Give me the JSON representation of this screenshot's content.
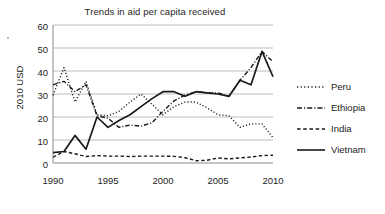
{
  "chart_data": {
    "type": "line",
    "title": "Trends in aid per capita received",
    "xlabel": "",
    "ylabel": "2010 USD",
    "xlim": [
      1990,
      2010
    ],
    "ylim": [
      0,
      60
    ],
    "grid": true,
    "legend_position": "right",
    "x": [
      1990,
      1991,
      1992,
      1993,
      1994,
      1995,
      1996,
      1997,
      1998,
      1999,
      2000,
      2001,
      2002,
      2003,
      2004,
      2005,
      2006,
      2007,
      2008,
      2009,
      2010
    ],
    "xticks": [
      "1990",
      "1995",
      "2000",
      "2005",
      "2010"
    ],
    "yticks": [
      "0",
      "10",
      "20",
      "30",
      "40",
      "50",
      "60"
    ],
    "series": [
      {
        "name": "Peru",
        "style": "dotted",
        "values": [
          29.5,
          41.5,
          26.5,
          35.5,
          21.0,
          20.5,
          22.5,
          26.5,
          30.0,
          25.5,
          21.0,
          24.5,
          26.5,
          26.5,
          24.0,
          21.0,
          20.5,
          15.5,
          17.0,
          17.0,
          11.0
        ]
      },
      {
        "name": "Ethiopia",
        "style": "dash-dot",
        "values": [
          34.0,
          35.5,
          31.0,
          34.0,
          20.5,
          19.5,
          15.5,
          16.5,
          16.0,
          17.5,
          22.5,
          27.0,
          29.5,
          31.0,
          30.5,
          30.5,
          29.0,
          36.0,
          41.5,
          48.5,
          44.0
        ]
      },
      {
        "name": "India",
        "style": "dashed",
        "values": [
          2.5,
          5.0,
          4.0,
          2.8,
          3.2,
          3.0,
          3.0,
          2.8,
          3.0,
          3.0,
          3.0,
          2.9,
          2.3,
          1.0,
          1.2,
          2.2,
          1.8,
          2.2,
          2.6,
          3.2,
          3.4
        ]
      },
      {
        "name": "Vietnam",
        "style": "solid",
        "values": [
          4.5,
          5.0,
          12.0,
          6.0,
          20.0,
          15.5,
          18.5,
          21.0,
          24.5,
          28.0,
          31.0,
          31.0,
          29.0,
          31.0,
          30.5,
          30.0,
          29.0,
          36.0,
          34.0,
          48.5,
          37.5
        ]
      }
    ],
    "colors": {
      "ink": "#1a1a1a",
      "grid": "#b5b5b5",
      "axis": "#8c8c8c",
      "background": "#ffffff"
    }
  }
}
